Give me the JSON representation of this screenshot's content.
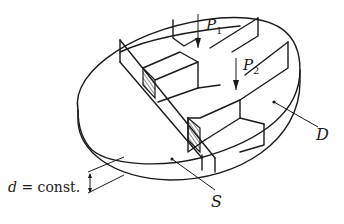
{
  "figure": {
    "colors": {
      "line": "#1a1a1a",
      "background": "#ffffff"
    }
  },
  "labels": {
    "p1": {
      "main": "P",
      "sub": "1"
    },
    "p2": {
      "main": "P",
      "sub": "2"
    },
    "domain": "D",
    "boundary": "S",
    "thickness_var": "d",
    "thickness_eq": " = const."
  }
}
